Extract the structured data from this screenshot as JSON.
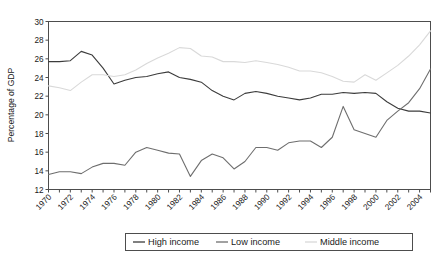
{
  "chart_data": {
    "type": "line",
    "title": "",
    "subtitle": "",
    "xlabel": "",
    "ylabel": "Percentage of GDP",
    "xlim": [
      1970,
      2005
    ],
    "ylim": [
      12,
      30
    ],
    "yticks": [
      12,
      14,
      16,
      18,
      20,
      22,
      24,
      26,
      28,
      30
    ],
    "xticks": [
      1970,
      1972,
      1974,
      1976,
      1978,
      1980,
      1982,
      1984,
      1986,
      1988,
      1990,
      1992,
      1994,
      1996,
      1998,
      2000,
      2002,
      2004
    ],
    "grid": false,
    "legend_position": "bottom-center",
    "x": [
      1970,
      1971,
      1972,
      1973,
      1974,
      1975,
      1976,
      1977,
      1978,
      1979,
      1980,
      1981,
      1982,
      1983,
      1984,
      1985,
      1986,
      1987,
      1988,
      1989,
      1990,
      1991,
      1992,
      1993,
      1994,
      1995,
      1996,
      1997,
      1998,
      1999,
      2000,
      2001,
      2002,
      2003,
      2004,
      2005
    ],
    "series": [
      {
        "name": "High income",
        "color": "#3c3c3c",
        "values": [
          25.7,
          25.7,
          25.8,
          26.8,
          26.4,
          25.0,
          23.3,
          23.7,
          24.0,
          24.1,
          24.4,
          24.6,
          24.0,
          23.8,
          23.5,
          22.6,
          22.0,
          21.6,
          22.3,
          22.5,
          22.3,
          22.0,
          21.8,
          21.6,
          21.8,
          22.2,
          22.2,
          22.4,
          22.3,
          22.4,
          22.3,
          21.4,
          20.7,
          20.4,
          20.4,
          20.2
        ]
      },
      {
        "name": "Low income",
        "color": "#6e6e6e",
        "values": [
          13.6,
          13.9,
          13.9,
          13.7,
          14.4,
          14.8,
          14.8,
          14.6,
          16.0,
          16.5,
          16.2,
          15.9,
          15.8,
          13.4,
          15.1,
          15.8,
          15.4,
          14.2,
          15.0,
          16.5,
          16.5,
          16.2,
          17.0,
          17.2,
          17.2,
          16.5,
          17.6,
          20.9,
          18.4,
          18.0,
          17.6,
          19.4,
          20.4,
          21.3,
          22.8,
          24.9
        ]
      },
      {
        "name": "Middle income",
        "color": "#d9d9d9",
        "values": [
          23.1,
          22.9,
          22.6,
          23.5,
          24.3,
          24.3,
          24.1,
          24.3,
          24.8,
          25.5,
          26.1,
          26.6,
          27.2,
          27.1,
          26.3,
          26.2,
          25.7,
          25.7,
          25.6,
          25.8,
          25.6,
          25.4,
          25.1,
          24.7,
          24.7,
          24.5,
          24.1,
          23.6,
          23.5,
          24.3,
          23.7,
          24.5,
          25.3,
          26.3,
          27.5,
          29.0
        ]
      }
    ],
    "legend": [
      {
        "label": "High income",
        "color": "#3c3c3c"
      },
      {
        "label": "Low income",
        "color": "#6e6e6e"
      },
      {
        "label": "Middle income",
        "color": "#d9d9d9"
      }
    ]
  }
}
